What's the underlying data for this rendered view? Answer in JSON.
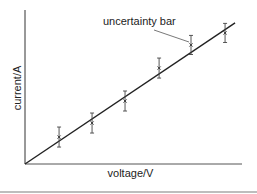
{
  "chart_data": {
    "type": "scatter",
    "title": "",
    "xlabel": "voltage/V",
    "ylabel": "current/A",
    "xlim": [
      0,
      10
    ],
    "ylim": [
      0,
      10
    ],
    "grid": false,
    "ticks": false,
    "legend": null,
    "series": [
      {
        "name": "measurements",
        "marker": "x",
        "x": [
          1.57,
          3.09,
          4.61,
          6.18,
          7.65,
          9.22
        ],
        "y": [
          1.75,
          2.66,
          4.09,
          6.23,
          7.73,
          8.51
        ],
        "yerr": [
          0.65,
          0.65,
          0.65,
          0.65,
          0.62,
          0.62
        ]
      },
      {
        "name": "best-fit line",
        "type": "line",
        "x": [
          0,
          9.68
        ],
        "y": [
          0,
          9.16
        ]
      }
    ],
    "annotations": [
      {
        "text": "uncertainty bar",
        "points_to_index": 4
      }
    ]
  },
  "labels": {
    "xlabel": "voltage/V",
    "ylabel": "current/A",
    "annotation": "uncertainty bar"
  },
  "colors": {
    "ink": "#222222",
    "axis": "#333333",
    "rule": "#bdbdbd"
  }
}
